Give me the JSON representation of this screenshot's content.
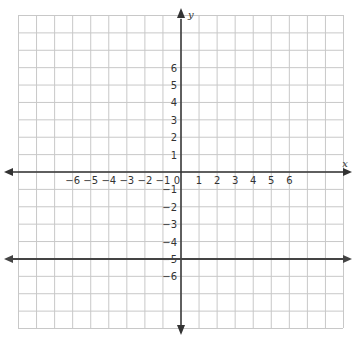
{
  "graph": {
    "x_axis_label": "x",
    "y_axis_label": "y",
    "x_range": [
      -9,
      9
    ],
    "y_range": [
      -9,
      9
    ],
    "x_tick_labels": [
      "-6",
      "-5",
      "-4",
      "-3",
      "-2",
      "-1",
      "0",
      "1",
      "2",
      "3",
      "4",
      "5",
      "6"
    ],
    "y_tick_labels_positive": [
      "1",
      "2",
      "3",
      "4",
      "5",
      "6"
    ],
    "y_tick_labels_negative": [
      "-1",
      "-2",
      "-3",
      "-4",
      "-5",
      "-6"
    ],
    "grid_color": "#c8c8c8",
    "axis_color": "#333333",
    "line": {
      "equation": "y = -5",
      "y_value": -5,
      "color": "#444444"
    }
  },
  "chart_data": {
    "type": "line",
    "title": "",
    "xlabel": "x",
    "ylabel": "y",
    "xlim": [
      -9,
      9
    ],
    "ylim": [
      -9,
      9
    ],
    "grid": true,
    "series": [
      {
        "name": "y = -5",
        "x": [
          -9,
          9
        ],
        "y": [
          -5,
          -5
        ]
      }
    ]
  }
}
